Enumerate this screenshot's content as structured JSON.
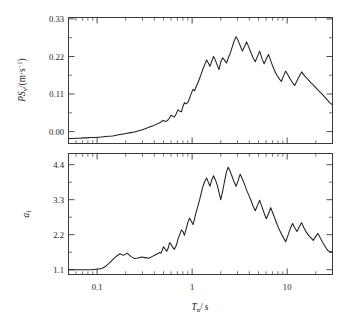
{
  "figure": {
    "background_color": "#ffffff",
    "line_color": "#202020",
    "axis_color": "#3a3a3a"
  },
  "chart_data": [
    {
      "type": "line",
      "panel": "top",
      "title": "",
      "xlabel": "T_n / s",
      "ylabel": "PS_v/(m·s⁻¹)",
      "xscale": "log",
      "xlim": [
        0.05,
        30
      ],
      "ylim": [
        -0.012,
        0.37
      ],
      "yticks": [
        0.0,
        0.11,
        0.22,
        0.33
      ],
      "ytick_labels": [
        "0.00",
        "0.11",
        "0.22",
        "0.33"
      ],
      "xticks": [
        0.1,
        1,
        10
      ],
      "xtick_labels": [
        "0.1",
        "1",
        "10"
      ],
      "grid": false,
      "legend": null,
      "x": [
        0.05,
        0.055,
        0.06,
        0.066,
        0.072,
        0.079,
        0.086,
        0.094,
        0.103,
        0.112,
        0.122,
        0.133,
        0.146,
        0.159,
        0.174,
        0.19,
        0.207,
        0.226,
        0.247,
        0.269,
        0.294,
        0.321,
        0.35,
        0.382,
        0.417,
        0.455,
        0.47,
        0.486,
        0.5,
        0.52,
        0.54,
        0.56,
        0.58,
        0.6,
        0.625,
        0.65,
        0.68,
        0.71,
        0.74,
        0.77,
        0.8,
        0.83,
        0.86,
        0.9,
        0.94,
        0.98,
        1.02,
        1.06,
        1.1,
        1.15,
        1.2,
        1.25,
        1.3,
        1.36,
        1.42,
        1.48,
        1.54,
        1.6,
        1.68,
        1.76,
        1.84,
        1.92,
        2.0,
        2.1,
        2.2,
        2.3,
        2.4,
        2.52,
        2.64,
        2.76,
        2.9,
        3.05,
        3.2,
        3.38,
        3.56,
        3.74,
        3.94,
        4.15,
        4.38,
        4.62,
        4.87,
        5.14,
        5.42,
        5.72,
        6.03,
        6.36,
        6.7,
        7.06,
        7.44,
        7.84,
        8.26,
        8.7,
        9.16,
        9.65,
        10.2,
        10.8,
        11.4,
        12.0,
        12.7,
        13.4,
        14.2,
        15.0,
        15.9,
        16.8,
        17.8,
        18.8,
        19.9,
        21.1,
        22.3,
        23.6,
        25.0,
        26.5,
        28.0,
        30.0
      ],
      "y": [
        0.003,
        0.003,
        0.004,
        0.004,
        0.005,
        0.005,
        0.006,
        0.006,
        0.007,
        0.008,
        0.009,
        0.01,
        0.011,
        0.013,
        0.015,
        0.017,
        0.019,
        0.021,
        0.023,
        0.026,
        0.029,
        0.033,
        0.037,
        0.041,
        0.046,
        0.051,
        0.053,
        0.057,
        0.058,
        0.055,
        0.056,
        0.06,
        0.066,
        0.074,
        0.07,
        0.068,
        0.078,
        0.09,
        0.086,
        0.084,
        0.1,
        0.112,
        0.108,
        0.112,
        0.125,
        0.14,
        0.152,
        0.148,
        0.16,
        0.172,
        0.186,
        0.2,
        0.214,
        0.228,
        0.241,
        0.232,
        0.222,
        0.235,
        0.252,
        0.24,
        0.225,
        0.212,
        0.235,
        0.248,
        0.24,
        0.232,
        0.247,
        0.262,
        0.28,
        0.298,
        0.312,
        0.3,
        0.285,
        0.268,
        0.282,
        0.296,
        0.281,
        0.264,
        0.248,
        0.236,
        0.252,
        0.268,
        0.246,
        0.23,
        0.244,
        0.258,
        0.24,
        0.222,
        0.206,
        0.194,
        0.184,
        0.176,
        0.193,
        0.208,
        0.196,
        0.183,
        0.172,
        0.164,
        0.178,
        0.192,
        0.205,
        0.196,
        0.188,
        0.18,
        0.172,
        0.166,
        0.158,
        0.15,
        0.143,
        0.136,
        0.128,
        0.12,
        0.112,
        0.105
      ]
    },
    {
      "type": "line",
      "panel": "bottom",
      "title": "",
      "xlabel": "T_n / s",
      "ylabel": "a_f",
      "xscale": "log",
      "xlim": [
        0.05,
        30
      ],
      "ylim": [
        0.95,
        4.75
      ],
      "yticks": [
        1.1,
        2.2,
        3.3,
        4.4
      ],
      "ytick_labels": [
        "1.1",
        "2.2",
        "3.3",
        "4.4"
      ],
      "xticks": [
        0.1,
        1,
        10
      ],
      "xtick_labels": [
        "0.1",
        "1",
        "10"
      ],
      "grid": false,
      "legend": null,
      "x": [
        0.05,
        0.055,
        0.06,
        0.066,
        0.072,
        0.079,
        0.086,
        0.094,
        0.103,
        0.112,
        0.122,
        0.133,
        0.146,
        0.159,
        0.174,
        0.19,
        0.207,
        0.226,
        0.247,
        0.269,
        0.294,
        0.321,
        0.35,
        0.382,
        0.417,
        0.455,
        0.47,
        0.486,
        0.5,
        0.52,
        0.54,
        0.56,
        0.58,
        0.6,
        0.625,
        0.65,
        0.68,
        0.71,
        0.74,
        0.77,
        0.8,
        0.83,
        0.86,
        0.9,
        0.94,
        0.98,
        1.02,
        1.06,
        1.1,
        1.15,
        1.2,
        1.25,
        1.3,
        1.36,
        1.42,
        1.48,
        1.54,
        1.6,
        1.68,
        1.76,
        1.84,
        1.92,
        2.0,
        2.1,
        2.2,
        2.3,
        2.4,
        2.52,
        2.64,
        2.76,
        2.9,
        3.05,
        3.2,
        3.38,
        3.56,
        3.74,
        3.94,
        4.15,
        4.38,
        4.62,
        4.87,
        5.14,
        5.42,
        5.72,
        6.03,
        6.36,
        6.7,
        7.06,
        7.44,
        7.84,
        8.26,
        8.7,
        9.16,
        9.65,
        10.2,
        10.8,
        11.4,
        12.0,
        12.7,
        13.4,
        14.2,
        15.0,
        15.9,
        16.8,
        17.8,
        18.8,
        19.9,
        21.1,
        22.3,
        23.6,
        25.0,
        26.5,
        28.0,
        30.0
      ],
      "y": [
        1.1,
        1.1,
        1.1,
        1.1,
        1.1,
        1.1,
        1.1,
        1.11,
        1.12,
        1.14,
        1.2,
        1.3,
        1.42,
        1.52,
        1.6,
        1.55,
        1.62,
        1.52,
        1.45,
        1.47,
        1.5,
        1.48,
        1.46,
        1.52,
        1.58,
        1.64,
        1.62,
        1.72,
        1.82,
        1.75,
        1.68,
        1.78,
        1.95,
        1.9,
        1.8,
        1.74,
        1.86,
        2.06,
        2.2,
        2.35,
        2.3,
        2.18,
        2.35,
        2.58,
        2.72,
        2.62,
        2.52,
        2.7,
        2.9,
        3.1,
        3.3,
        3.52,
        3.72,
        3.88,
        3.98,
        3.85,
        3.72,
        3.9,
        4.05,
        3.92,
        3.75,
        3.52,
        3.3,
        3.58,
        3.9,
        4.18,
        4.32,
        4.18,
        4.02,
        3.86,
        3.72,
        3.9,
        4.1,
        3.95,
        3.78,
        3.6,
        3.45,
        3.28,
        3.1,
        2.95,
        3.12,
        3.28,
        3.08,
        2.88,
        2.7,
        2.85,
        3.05,
        2.88,
        2.7,
        2.52,
        2.36,
        2.22,
        2.1,
        1.98,
        2.18,
        2.4,
        2.55,
        2.42,
        2.3,
        2.45,
        2.58,
        2.42,
        2.28,
        2.18,
        2.1,
        2.02,
        2.14,
        2.24,
        2.1,
        1.96,
        1.84,
        1.72,
        1.66,
        1.66
      ]
    }
  ],
  "labels": {
    "top_y_axis": {
      "prefix_italic": "PS",
      "subscript": "v",
      "unit_open": "/(",
      "unit_m": "m",
      "unit_dot": "·",
      "unit_s": "s",
      "unit_exp": "−1",
      "unit_close": ")"
    },
    "bottom_y_axis": {
      "symbol": "a",
      "subscript": "f"
    },
    "x_axis": {
      "symbol": "T",
      "subscript": "n",
      "divider": "/ s"
    }
  }
}
